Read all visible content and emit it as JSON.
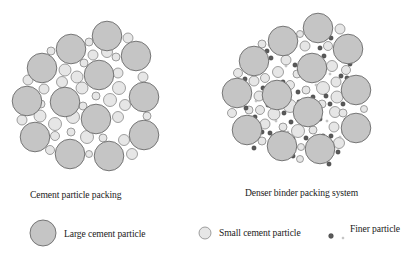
{
  "figures": [
    {
      "id": "cement-particle-packing",
      "caption": "Cement particle packing",
      "large": [
        [
          107,
          36
        ],
        [
          71,
          49
        ],
        [
          136,
          56
        ],
        [
          42,
          68
        ],
        [
          99,
          75
        ],
        [
          27,
          101
        ],
        [
          65,
          102
        ],
        [
          144,
          97
        ],
        [
          96,
          119
        ],
        [
          35,
          137
        ],
        [
          144,
          135
        ],
        [
          70,
          154
        ],
        [
          109,
          156
        ]
      ],
      "large_r": 14.8,
      "small": [
        [
          51,
          51,
          4
        ],
        [
          89,
          42,
          4
        ],
        [
          128,
          38,
          5
        ],
        [
          116,
          57,
          4
        ],
        [
          107,
          52,
          5.5
        ],
        [
          93,
          55,
          5
        ],
        [
          84,
          63,
          4
        ],
        [
          65,
          70,
          6
        ],
        [
          77,
          77,
          6
        ],
        [
          118,
          73,
          5
        ],
        [
          143,
          77,
          5
        ],
        [
          28,
          80,
          5
        ],
        [
          44,
          89,
          5
        ],
        [
          62,
          82,
          5.5
        ],
        [
          82,
          88,
          6
        ],
        [
          119,
          88,
          6.5
        ],
        [
          96,
          96,
          4
        ],
        [
          110,
          100,
          6.5
        ],
        [
          125,
          105,
          5.5
        ],
        [
          41,
          104,
          4
        ],
        [
          22,
          120,
          5
        ],
        [
          40,
          116,
          6
        ],
        [
          55,
          124,
          6.5
        ],
        [
          73,
          117,
          6.5
        ],
        [
          83,
          106,
          4
        ],
        [
          118,
          117,
          5.5
        ],
        [
          147,
          116,
          4
        ],
        [
          55,
          136,
          4.5
        ],
        [
          71,
          132,
          4
        ],
        [
          87,
          137,
          6.5
        ],
        [
          103,
          138,
          4
        ],
        [
          124,
          140,
          5.5
        ],
        [
          50,
          150,
          4.5
        ],
        [
          89,
          154,
          3.5
        ],
        [
          132,
          154,
          5.5
        ]
      ]
    },
    {
      "id": "denser-binder-packing",
      "caption": "Denser binder packing system",
      "large": [
        [
          318,
          28
        ],
        [
          283,
          41
        ],
        [
          348,
          49
        ],
        [
          254,
          61
        ],
        [
          312,
          68
        ],
        [
          237,
          93
        ],
        [
          277,
          95
        ],
        [
          356,
          90
        ],
        [
          308,
          112
        ],
        [
          247,
          130
        ],
        [
          356,
          128
        ],
        [
          282,
          146
        ],
        [
          320,
          149
        ]
      ],
      "large_r": 14.8,
      "small": [
        [
          262,
          44,
          4
        ],
        [
          300,
          34,
          3.5
        ],
        [
          340,
          29,
          5
        ],
        [
          328,
          46,
          4.5
        ],
        [
          305,
          46,
          5
        ],
        [
          286,
          60,
          5
        ],
        [
          278,
          72,
          5.5
        ],
        [
          265,
          78,
          4.5
        ],
        [
          297,
          74,
          4
        ],
        [
          332,
          66,
          5.5
        ],
        [
          346,
          70,
          4.5
        ],
        [
          238,
          73,
          4.5
        ],
        [
          254,
          81,
          5
        ],
        [
          259,
          96,
          5
        ],
        [
          290,
          85,
          4.5
        ],
        [
          306,
          90,
          4
        ],
        [
          323,
          88,
          6.5
        ],
        [
          336,
          82,
          5
        ],
        [
          337,
          97,
          6
        ],
        [
          260,
          110,
          4.5
        ],
        [
          274,
          114,
          6
        ],
        [
          290,
          106,
          6.5
        ],
        [
          322,
          104,
          4
        ],
        [
          335,
          112,
          5.5
        ],
        [
          232,
          113,
          4.5
        ],
        [
          249,
          110,
          4
        ],
        [
          265,
          124,
          5
        ],
        [
          283,
          127,
          4
        ],
        [
          298,
          131,
          6.5
        ],
        [
          313,
          130,
          4
        ],
        [
          334,
          127,
          5
        ],
        [
          343,
          113,
          4
        ],
        [
          262,
          141,
          4
        ],
        [
          301,
          147,
          3.5
        ],
        [
          339,
          143,
          5.5
        ],
        [
          300,
          159,
          3.5
        ],
        [
          364,
          109,
          3.5
        ]
      ],
      "fine": [
        [
          267,
          51
        ],
        [
          271,
          58
        ],
        [
          289,
          51
        ],
        [
          320,
          48
        ],
        [
          331,
          38
        ],
        [
          324,
          56
        ],
        [
          340,
          58
        ],
        [
          274,
          84
        ],
        [
          283,
          82
        ],
        [
          295,
          65
        ],
        [
          318,
          77
        ],
        [
          341,
          76
        ],
        [
          350,
          64
        ],
        [
          245,
          79
        ],
        [
          248,
          93
        ],
        [
          263,
          88
        ],
        [
          298,
          92
        ],
        [
          313,
          97
        ],
        [
          326,
          96
        ],
        [
          347,
          78
        ],
        [
          344,
          90
        ],
        [
          246,
          108
        ],
        [
          268,
          105
        ],
        [
          282,
          101
        ],
        [
          284,
          113
        ],
        [
          299,
          102
        ],
        [
          312,
          119
        ],
        [
          320,
          119
        ],
        [
          330,
          104
        ],
        [
          343,
          104
        ],
        [
          346,
          120
        ],
        [
          240,
          120
        ],
        [
          255,
          117
        ],
        [
          270,
          133
        ],
        [
          291,
          122
        ],
        [
          305,
          124
        ],
        [
          323,
          136
        ],
        [
          331,
          136
        ],
        [
          344,
          132
        ],
        [
          262,
          132
        ],
        [
          273,
          137
        ],
        [
          293,
          139
        ],
        [
          306,
          138
        ],
        [
          312,
          141
        ],
        [
          338,
          152
        ],
        [
          293,
          156
        ],
        [
          329,
          164
        ],
        [
          254,
          148
        ]
      ],
      "fine_r": 2.2,
      "finest": [
        [
          269,
          45
        ],
        [
          286,
          66
        ],
        [
          303,
          57
        ],
        [
          316,
          85
        ],
        [
          330,
          74
        ],
        [
          256,
          101
        ],
        [
          271,
          92
        ],
        [
          296,
          115
        ],
        [
          327,
          121
        ],
        [
          276,
          121
        ],
        [
          315,
          136
        ],
        [
          251,
          121
        ],
        [
          340,
          137
        ],
        [
          288,
          132
        ]
      ],
      "finest_r": 1.1
    }
  ],
  "legend": {
    "items": [
      {
        "id": "large",
        "label": "Large cement particle",
        "cx": 43,
        "cy": 233,
        "r": 13
      },
      {
        "id": "small",
        "label": "Small cement particle",
        "cx": 205,
        "cy": 233,
        "r": 6
      },
      {
        "id": "finer",
        "label": "Finer particle",
        "dark": {
          "cx": 331,
          "cy": 236,
          "r": 2.4
        },
        "light": {
          "cx": 343,
          "cy": 238,
          "r": 1
        }
      }
    ]
  }
}
